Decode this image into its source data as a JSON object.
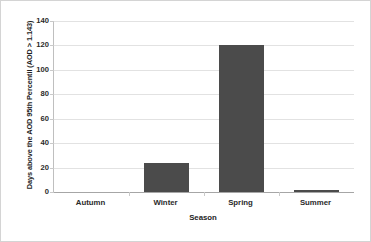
{
  "chart_data": {
    "type": "bar",
    "title": "",
    "categories": [
      "Autumn",
      "Winter",
      "Spring",
      "Summer"
    ],
    "values": [
      0,
      24,
      120,
      1
    ],
    "xlabel": "Season",
    "ylabel": "Days above the AOD 95th  Percentil (AOD > 1.143)",
    "ylim": [
      0,
      140
    ],
    "yticks": [
      0,
      20,
      40,
      60,
      80,
      100,
      120,
      140
    ],
    "grid": true,
    "legend": false,
    "bar_color": "#4b4b4b",
    "gridline_color": "#e2e2e2",
    "axis_color": "#a6a6a6",
    "frame_color": "#d4d4d4"
  }
}
